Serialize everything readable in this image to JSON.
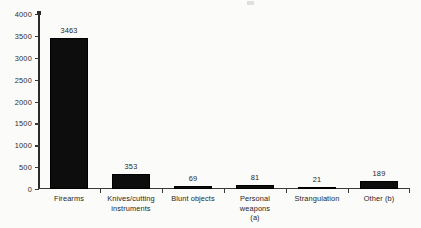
{
  "chart_data": {
    "type": "bar",
    "title": "",
    "subtitle": "",
    "xlabel": "",
    "ylabel": "",
    "categories": [
      "Firearms",
      "Knives/cutting instruments",
      "Blunt objects",
      "Personal weapons (a)",
      "Strangulation",
      "Other (b)"
    ],
    "category_lines": [
      [
        "Firearms"
      ],
      [
        "Knives/cutting",
        "instruments"
      ],
      [
        "Blunt objects"
      ],
      [
        "Personal weapons",
        "(a)"
      ],
      [
        "Strangulation"
      ],
      [
        "Other (b)"
      ]
    ],
    "values": [
      3463,
      353,
      69,
      81,
      21,
      189
    ],
    "value_labels": [
      "3463",
      "353",
      "69",
      "81",
      "21",
      "189"
    ],
    "ylim": [
      0,
      4000
    ],
    "ytick_step": 500,
    "ytick_values": [
      0,
      500,
      1000,
      1500,
      2000,
      2500,
      3000,
      3500,
      4000
    ],
    "ytick_labels": [
      "0",
      "500",
      "1000",
      "1500",
      "2000",
      "2500",
      "3000",
      "3500",
      "4000"
    ],
    "grid": false,
    "legend": null,
    "legend_position": "none",
    "bar_color": "#0d0d0d",
    "axis_color": "#3a3a3a",
    "background_color": "#fbfbfa"
  }
}
